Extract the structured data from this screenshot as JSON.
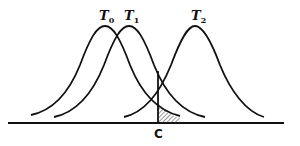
{
  "diagram": {
    "type": "overlapping normal distributions with decision criterion",
    "curves": [
      {
        "label": "T",
        "subscript": "0",
        "peak_x": 105
      },
      {
        "label": "T",
        "subscript": "1",
        "peak_x": 129
      },
      {
        "label": "T",
        "subscript": "2",
        "peak_x": 195
      }
    ],
    "criterion": {
      "label": "C",
      "x": 158
    },
    "shaded_region": "tail of T0 distribution to the right of criterion C",
    "colors": {
      "stroke": "#111111",
      "background": "#ffffff"
    }
  }
}
